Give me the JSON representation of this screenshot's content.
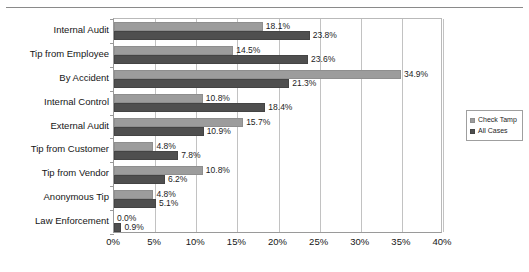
{
  "chart_data": {
    "type": "bar",
    "orientation": "horizontal",
    "title": "",
    "xlabel": "",
    "ylabel": "",
    "xlim": [
      0,
      40
    ],
    "xtick_labels": [
      "0%",
      "5%",
      "10%",
      "15%",
      "20%",
      "25%",
      "30%",
      "35%",
      "40%"
    ],
    "xtick_values": [
      0,
      5,
      10,
      15,
      20,
      25,
      30,
      35,
      40
    ],
    "grid": true,
    "legend_position": "right",
    "categories": [
      "Internal Audit",
      "Tip from Employee",
      "By Accident",
      "Internal Control",
      "External Audit",
      "Tip from Customer",
      "Tip from Vendor",
      "Anonymous Tip",
      "Law Enforcement"
    ],
    "series": [
      {
        "name": "Check Tamp",
        "color": "#9c9c9c",
        "values": [
          18.1,
          14.5,
          34.9,
          10.8,
          15.7,
          4.8,
          10.8,
          4.8,
          0.0
        ],
        "labels": [
          "18.1%",
          "14.5%",
          "34.9%",
          "10.8%",
          "15.7%",
          "4.8%",
          "10.8%",
          "4.8%",
          "0.0%"
        ]
      },
      {
        "name": "All Cases",
        "color": "#4f4f4f",
        "values": [
          23.8,
          23.6,
          21.3,
          18.4,
          10.9,
          7.8,
          6.2,
          5.1,
          0.9
        ],
        "labels": [
          "23.8%",
          "23.6%",
          "21.3%",
          "18.4%",
          "10.9%",
          "7.8%",
          "6.2%",
          "5.1%",
          "0.9%"
        ]
      }
    ]
  },
  "legend": {
    "items": [
      {
        "label": "Check Tamp"
      },
      {
        "label": "All Cases"
      }
    ]
  }
}
